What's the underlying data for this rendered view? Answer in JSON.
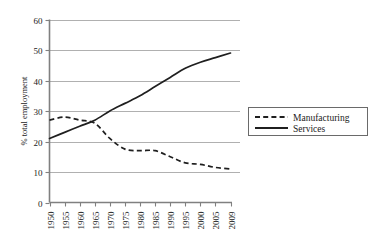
{
  "chart_data": {
    "type": "line",
    "title": "",
    "xlabel": "",
    "ylabel": "% total employment",
    "ylim": [
      0,
      60
    ],
    "yticks": [
      0,
      10,
      20,
      30,
      40,
      50,
      60
    ],
    "grid": true,
    "legend_position": "right",
    "categories": [
      "1950",
      "1955",
      "1960",
      "1965",
      "1970",
      "1975",
      "1980",
      "1985",
      "1990",
      "1995",
      "2000",
      "2005",
      "2009"
    ],
    "series": [
      {
        "name": "Manufacturing",
        "style": "dashed",
        "color": "#1f1f1f",
        "values": [
          27,
          28,
          27,
          26,
          21,
          17.5,
          17,
          17,
          15,
          13,
          12.5,
          11.5,
          11
        ]
      },
      {
        "name": "Services",
        "style": "solid",
        "color": "#1f1f1f",
        "values": [
          21,
          23,
          25,
          27,
          30,
          32.5,
          35,
          38,
          41,
          44,
          46,
          47.5,
          49
        ]
      }
    ]
  },
  "legend": {
    "entries": [
      {
        "label": "Manufacturing",
        "style": "dashed"
      },
      {
        "label": "Services",
        "style": "solid"
      }
    ]
  },
  "colors": {
    "gridline": "#b0b0b0",
    "axis": "#808080",
    "line": "#1f1f1f",
    "background": "#ffffff"
  }
}
